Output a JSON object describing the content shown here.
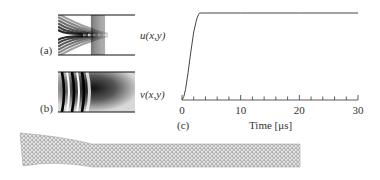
{
  "panels": {
    "a": {
      "label": "(a)",
      "field_label": "u(x,y)"
    },
    "b": {
      "label": "(b)",
      "field_label": "v(x,y)"
    },
    "c": {
      "label": "(c)"
    }
  },
  "chart_data": {
    "type": "line",
    "title": "",
    "xlabel": "Time [μs]",
    "ylabel": "",
    "xlim": [
      0,
      30
    ],
    "ylim": [
      0,
      1
    ],
    "x_ticks_major": [
      0,
      10,
      20,
      30
    ],
    "x_tick_labels": [
      "0",
      "10",
      "20",
      "30"
    ],
    "x_minor_step": 2,
    "grid": false,
    "series": [
      {
        "name": "response",
        "x": [
          0,
          0.3,
          0.6,
          1.0,
          1.5,
          2.0,
          2.5,
          2.8,
          3.0,
          3.3,
          4,
          10,
          20,
          30
        ],
        "y": [
          0,
          0.04,
          0.12,
          0.3,
          0.55,
          0.78,
          0.93,
          0.98,
          1.0,
          1.0,
          1.0,
          1.0,
          1.0,
          1.0
        ]
      }
    ]
  },
  "mesh": {
    "description": "deformed finite-element mesh (bent beam)"
  }
}
